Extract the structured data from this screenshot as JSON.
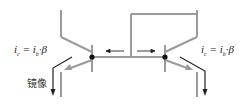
{
  "diagram": {
    "type": "current-mirror",
    "left_formula": {
      "i": "i",
      "sub1": "c",
      "eq": " = ",
      "i2": "i",
      "sub2": "b",
      "tail": "·β"
    },
    "right_formula": {
      "i": "i",
      "sub1": "c",
      "eq": " = ",
      "i2": "i",
      "sub2": "b",
      "tail": "·β"
    },
    "mirror_label": "镜像",
    "colors": {
      "wire": "#9a9a9a",
      "arrow": "#222222",
      "node": "#111111"
    }
  }
}
